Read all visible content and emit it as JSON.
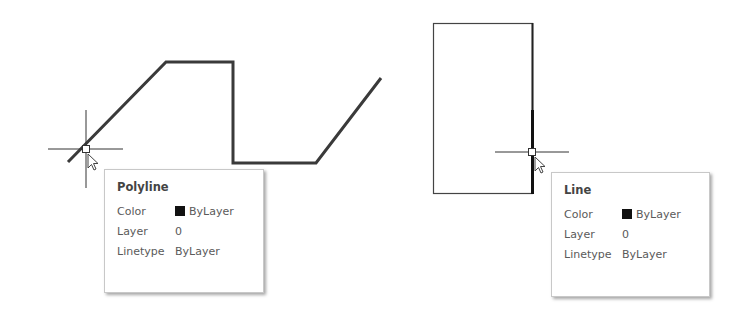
{
  "drawing": {
    "polyline": {
      "points": "68,162 166,62 233,62 233,163 316,163 381,78",
      "stroke": "#3a3a3a"
    },
    "line_rectangle": {
      "x": 433,
      "y": 23,
      "width": 99,
      "height": 170,
      "stroke": "#444444",
      "highlighted_segment": {
        "x1": 532,
        "y1": 110,
        "x2": 532,
        "y2": 193
      }
    }
  },
  "tooltips": [
    {
      "title": "Polyline",
      "rows": [
        {
          "label": "Color",
          "value": "ByLayer",
          "swatch": "#111111"
        },
        {
          "label": "Layer",
          "value": "0"
        },
        {
          "label": "Linetype",
          "value": "ByLayer"
        }
      ]
    },
    {
      "title": "Line",
      "rows": [
        {
          "label": "Color",
          "value": "ByLayer",
          "swatch": "#111111"
        },
        {
          "label": "Layer",
          "value": "0"
        },
        {
          "label": "Linetype",
          "value": "ByLayer"
        }
      ]
    }
  ]
}
